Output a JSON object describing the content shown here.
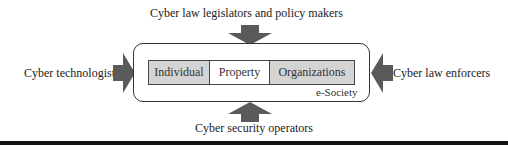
{
  "diagram": {
    "top_label": "Cyber law legislators and policy makers",
    "left_label": "Cyber technologists",
    "right_label": "Cyber law enforcers",
    "bottom_label": "Cyber security operators",
    "container_label": "e-Society",
    "cells": [
      {
        "label": "Individual",
        "shaded": true
      },
      {
        "label": "Property",
        "shaded": false
      },
      {
        "label": "Organizations",
        "shaded": true
      }
    ],
    "colors": {
      "arrow": "#5a5a5a",
      "cell_shade": "#d4d4d4",
      "border": "#333333"
    }
  }
}
